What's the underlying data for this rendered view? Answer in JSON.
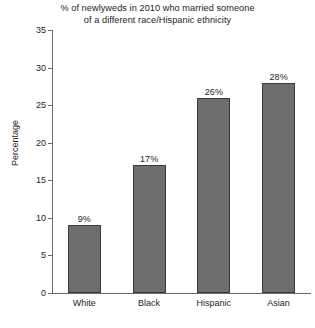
{
  "chart_data": {
    "type": "bar",
    "title": "% of newlyweds in 2010 who married someone of a different race/Hispanic ethnicity",
    "title_line1": "% of newlyweds in 2010 who married someone",
    "title_line2": "of a different race/Hispanic ethnicity",
    "xlabel": "",
    "ylabel": "Percentage",
    "categories": [
      "White",
      "Black",
      "Hispanic",
      "Asian"
    ],
    "values": [
      9,
      17,
      26,
      28
    ],
    "value_labels": [
      "9%",
      "17%",
      "26%",
      "28%"
    ],
    "ylim": [
      0,
      35
    ],
    "ytick_step": 5,
    "yticks": [
      0,
      5,
      10,
      15,
      20,
      25,
      30,
      35
    ],
    "ytick_labels": [
      "0",
      "5",
      "10",
      "15",
      "20",
      "25",
      "30",
      "35"
    ],
    "grid": false,
    "legend": false,
    "bar_color": "#6e6e6e",
    "bar_edge_color": "#3b3b3b",
    "axis_color": "#6a6a6a",
    "background_color": "#ffffff",
    "text_color": "#1d1d1d"
  }
}
